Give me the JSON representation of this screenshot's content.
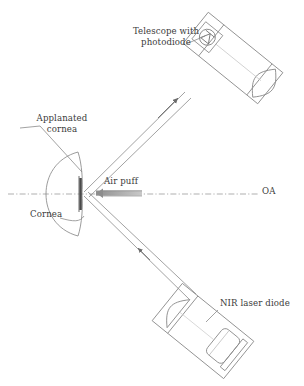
{
  "figure": {
    "background_color": "#ffffff",
    "line_color": "#6b6b6b",
    "text_color": "#3b3b3b",
    "accent_color": "#9a9a9a",
    "width": 304,
    "height": 386
  },
  "labels": {
    "telescope": "Telescope with\nphotodiode",
    "telescope_line1": "Telescope with",
    "telescope_line2": "photodiode",
    "applanated_cornea_line1": "Applanated",
    "applanated_cornea_line2": "cornea",
    "air_puff": "Air puff",
    "optical_axis": "OA",
    "cornea": "Cornea",
    "nir_laser_diode": "NIR laser diode"
  },
  "components": [
    {
      "name": "telescope-with-photodiode",
      "label": "Telescope with photodiode",
      "parts": [
        "objective-lens",
        "tube-housing",
        "photodiode"
      ],
      "orientation_deg": -52
    },
    {
      "name": "nir-laser-diode",
      "label": "NIR laser diode",
      "parts": [
        "collimating-lens",
        "diode-housing",
        "laser-chip"
      ],
      "orientation_deg": 52
    },
    {
      "name": "cornea",
      "label": "Cornea",
      "state": "applanated",
      "parts": [
        "corneal-arc",
        "applanated-flat-zone"
      ]
    },
    {
      "name": "air-puff-jet",
      "label": "Air puff",
      "direction": "leftward-toward-cornea"
    },
    {
      "name": "optical-axis",
      "label": "OA",
      "style": "dash-dot"
    }
  ],
  "beams": [
    {
      "name": "incident-beam",
      "from": "nir-laser-diode",
      "to": "cornea-apex",
      "arrowheads": 1
    },
    {
      "name": "reflected-beam",
      "from": "cornea-apex",
      "to": "telescope-with-photodiode",
      "arrowheads": 1
    }
  ]
}
